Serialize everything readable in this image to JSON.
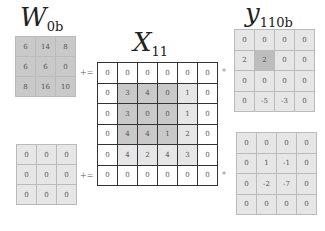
{
  "colors": {
    "dark_shade": "#c9c9c9",
    "light_shade": "#e6e6e6",
    "white": "#ffffff",
    "highlight": "#bdbdbd"
  },
  "labels": {
    "w": {
      "main": "W",
      "sub": "0b"
    },
    "x": {
      "main": "X",
      "sub": "11"
    },
    "y": {
      "main": "y",
      "sub": "110b"
    }
  },
  "operators": {
    "plus_equals": "+=",
    "star": "*"
  },
  "w_top": {
    "cells": [
      [
        6,
        14,
        8
      ],
      [
        6,
        6,
        0
      ],
      [
        8,
        16,
        10
      ]
    ],
    "shade": [
      [
        "d",
        "d",
        "d"
      ],
      [
        "d",
        "d",
        "d"
      ],
      [
        "d",
        "d",
        "d"
      ]
    ]
  },
  "w_bottom": {
    "cells": [
      [
        0,
        0,
        0
      ],
      [
        0,
        0,
        0
      ],
      [
        0,
        0,
        0
      ]
    ],
    "shade": [
      [
        "l",
        "l",
        "l"
      ],
      [
        "l",
        "l",
        "l"
      ],
      [
        "l",
        "l",
        "l"
      ]
    ]
  },
  "x": {
    "cells": [
      [
        0,
        0,
        0,
        0,
        0,
        0
      ],
      [
        0,
        3,
        4,
        0,
        1,
        0
      ],
      [
        0,
        3,
        0,
        0,
        1,
        0
      ],
      [
        0,
        4,
        4,
        1,
        2,
        0
      ],
      [
        0,
        4,
        2,
        4,
        3,
        0
      ],
      [
        0,
        0,
        0,
        0,
        0,
        0
      ]
    ],
    "shade": [
      [
        "w",
        "w",
        "w",
        "w",
        "w",
        "w"
      ],
      [
        "w",
        "d",
        "d",
        "d",
        "l",
        "w"
      ],
      [
        "w",
        "d",
        "d",
        "d",
        "l",
        "w"
      ],
      [
        "w",
        "d",
        "d",
        "d",
        "l",
        "w"
      ],
      [
        "w",
        "l",
        "l",
        "l",
        "l",
        "w"
      ],
      [
        "w",
        "w",
        "w",
        "w",
        "w",
        "w"
      ]
    ]
  },
  "y_top": {
    "cells": [
      [
        0,
        0,
        0,
        0
      ],
      [
        2,
        2,
        0,
        0
      ],
      [
        0,
        0,
        0,
        0
      ],
      [
        0,
        -5,
        -3,
        0
      ]
    ],
    "shade": [
      [
        "l",
        "l",
        "l",
        "l"
      ],
      [
        "l",
        "h",
        "l",
        "l"
      ],
      [
        "l",
        "l",
        "l",
        "l"
      ],
      [
        "l",
        "l",
        "l",
        "l"
      ]
    ]
  },
  "y_bottom": {
    "cells": [
      [
        0,
        0,
        0,
        0
      ],
      [
        0,
        1,
        -1,
        0
      ],
      [
        0,
        -2,
        -7,
        0
      ],
      [
        0,
        0,
        0,
        0
      ]
    ],
    "shade": [
      [
        "l",
        "l",
        "l",
        "l"
      ],
      [
        "l",
        "l",
        "l",
        "l"
      ],
      [
        "l",
        "l",
        "l",
        "l"
      ],
      [
        "l",
        "l",
        "l",
        "l"
      ]
    ]
  }
}
